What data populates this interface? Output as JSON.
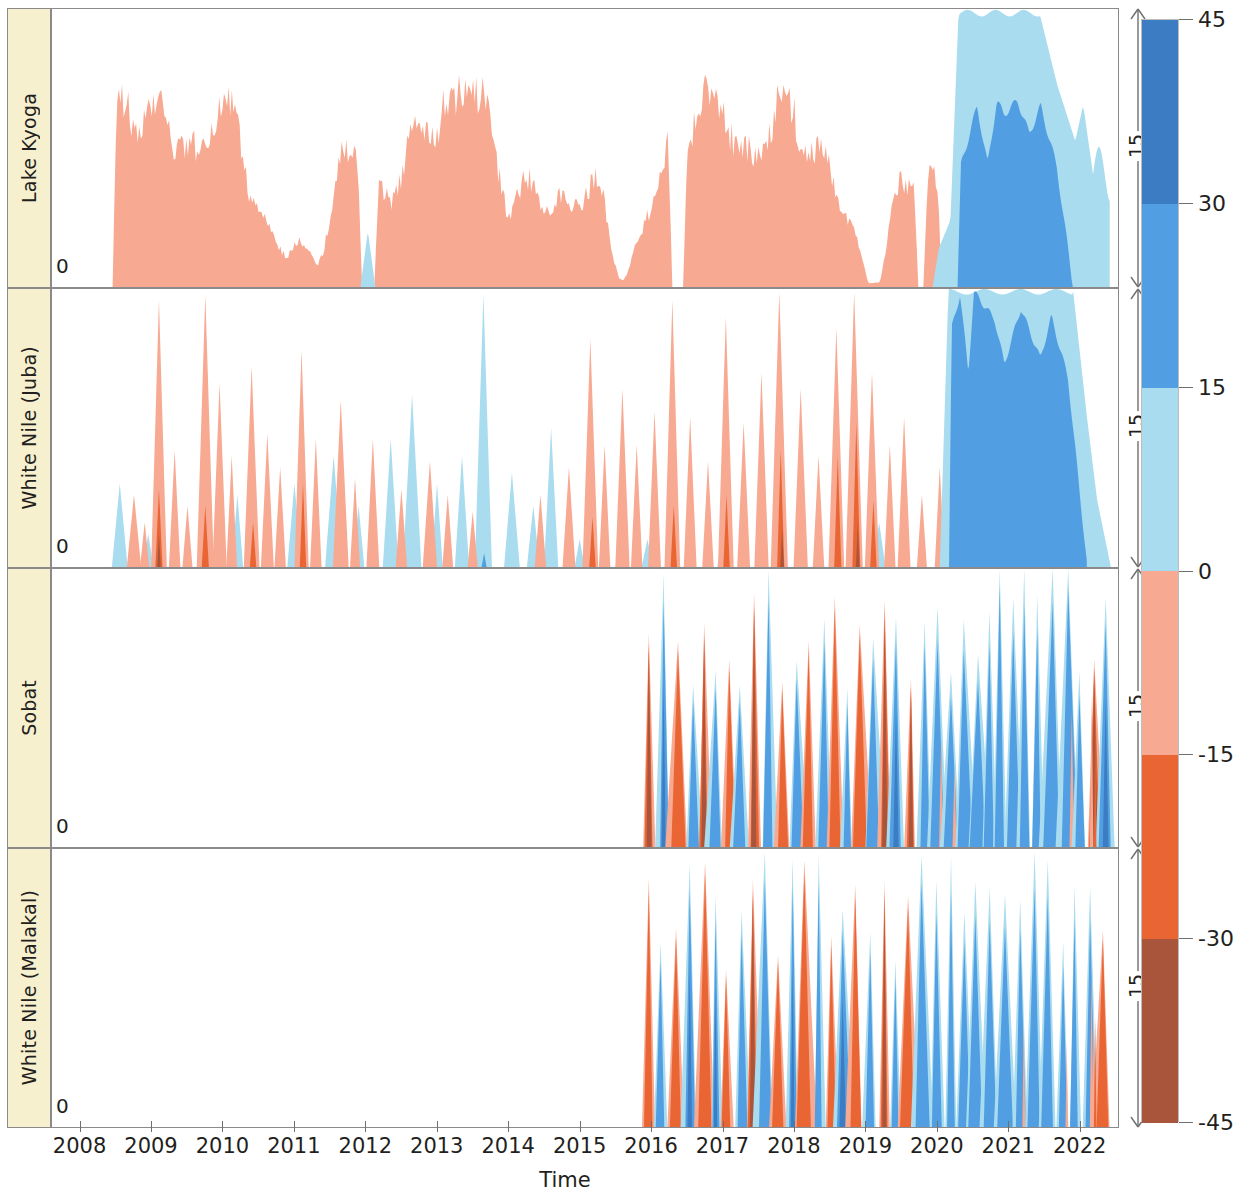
{
  "figure": {
    "type": "stacked-anomaly-ridgeline",
    "xlabel": "Time",
    "background": "#ffffff"
  },
  "axis": {
    "xlabel": "Time",
    "x_ticks": [
      "2008",
      "2009",
      "2010",
      "2011",
      "2012",
      "2013",
      "2014",
      "2015",
      "2016",
      "2017",
      "2018",
      "2019",
      "2020",
      "2021",
      "2022"
    ],
    "x_range": [
      2007.6,
      2022.55
    ],
    "zero_label": "0",
    "scale_bar_label": "15"
  },
  "colorbar": {
    "ticks": [
      "45",
      "30",
      "15",
      "0",
      "-15",
      "-30",
      "-45"
    ],
    "tick_values": [
      45,
      30,
      15,
      0,
      -15,
      -30,
      -45
    ],
    "vmin": -45,
    "vmax": 45,
    "bands": [
      {
        "from": 30,
        "to": 45,
        "color": "#3b7cc2"
      },
      {
        "from": 15,
        "to": 30,
        "color": "#519fe2"
      },
      {
        "from": 0,
        "to": 15,
        "color": "#a9dcef"
      },
      {
        "from": -15,
        "to": 0,
        "color": "#f8a992"
      },
      {
        "from": -30,
        "to": -15,
        "color": "#ea6534"
      },
      {
        "from": -45,
        "to": -30,
        "color": "#a9553c"
      }
    ]
  },
  "panels": [
    {
      "id": "lake-kyoga",
      "label": "Lake Kyoga",
      "zero_label": "0",
      "scale_label": "15"
    },
    {
      "id": "white-nile-juba",
      "label": "White Nile (Juba)",
      "zero_label": "0",
      "scale_label": "15"
    },
    {
      "id": "sobat",
      "label": "Sobat",
      "zero_label": "0",
      "scale_label": "15"
    },
    {
      "id": "white-nile-malakal",
      "label": "White Nile (Malakal)",
      "zero_label": "0",
      "scale_label": "15"
    }
  ],
  "chart_data": {
    "type": "area",
    "title": "",
    "xlabel": "Time",
    "ylabel": "",
    "x_range": [
      2007.6,
      2022.55
    ],
    "x_tick_labels": [
      "2008",
      "2009",
      "2010",
      "2011",
      "2012",
      "2013",
      "2014",
      "2015",
      "2016",
      "2017",
      "2018",
      "2019",
      "2020",
      "2021",
      "2022"
    ],
    "ylim": [
      0,
      15
    ],
    "grid": false,
    "legend": "colorbar-right",
    "colorbar_ticks": [
      45,
      30,
      15,
      0,
      -15,
      -30,
      -45
    ],
    "note": "Each panel shows nested filled areas; fill colour encodes anomaly magnitude class from the colorbar. Series values below are monthly-ish samples of the outer envelope height (panel units, 0-15) and the colour band index used for each segment.",
    "band_colors": [
      "#3b7cc2",
      "#519fe2",
      "#a9dcef",
      "#f8a992",
      "#ea6534",
      "#a9553c"
    ],
    "series": [
      {
        "name": "Lake Kyoga",
        "panel": "lake-kyoga",
        "x_start": 2007.6,
        "dx": 0.0833,
        "bands": [
          {
            "class": "0_to_-15",
            "color": "#f8a992",
            "values": [
              0,
              0,
              0,
              0,
              0,
              0,
              0,
              0,
              0,
              0,
              0,
              0,
              3.6,
              4.1,
              3.2,
              4.2,
              3.5,
              3.4,
              2.9,
              2.9,
              5.0,
              7.4,
              8.3,
              8.0,
              8.6,
              7.9,
              8.0,
              8.3,
              9.6,
              8.6,
              9.0,
              9.4,
              7.4,
              3.4,
              1.6,
              2.4,
              5.4,
              6.6,
              5.1,
              4.3,
              2.4,
              1.3,
              0.9,
              0.0,
              0.0,
              0.0,
              2.6,
              4.4,
              5.6,
              5.3,
              4.6,
              5.8,
              6.6,
              7.3,
              8.0,
              6.4,
              7.2,
              8.3,
              9.3,
              8.8,
              9.5,
              8.0,
              6.6,
              7.1,
              6.4,
              6.0,
              5.4,
              4.9,
              4.0,
              3.0,
              2.1,
              2.6,
              3.8,
              5.8,
              7.4,
              7.0,
              6.6,
              7.2,
              6.4,
              5.9,
              5.3,
              4.2,
              3.1,
              2.0,
              1.4,
              0.8,
              0.4,
              1.0,
              3.6,
              6.2,
              7.0,
              7.6,
              6.8,
              5.6,
              4.4,
              3.2,
              2.0,
              1.2,
              0.6,
              0.2,
              0.0,
              0.0,
              0.0,
              0.0,
              0.0,
              0.0,
              0.0,
              0.0,
              0.0,
              0.0,
              0.0,
              0.0,
              0.0,
              0.0,
              0.0,
              0.0,
              0.0,
              0.0,
              0.0,
              0.0,
              0.0,
              0.0,
              0.0,
              0.0,
              0.0,
              0.0,
              0.0,
              0.0,
              0.0,
              0.0,
              0.0,
              0.0,
              0.0,
              0.0,
              0.0,
              0.0,
              0.0,
              0.0,
              0.0,
              0.0,
              0.0,
              0.0,
              0.0,
              0.0,
              0.0,
              0.0,
              0.0,
              0.0,
              0.0,
              0.0,
              0.0,
              0.0,
              0.0,
              0.0,
              0.0,
              0.0,
              0.0,
              0.0,
              0.0,
              0.0,
              0.0,
              0.0,
              0.0,
              0.0,
              0.0,
              0.0,
              0.0,
              0.0,
              0.0,
              0.0,
              0.0,
              0.0
            ]
          },
          {
            "class": "0_to_15",
            "color": "#a9dcef",
            "values": [
              0,
              0,
              0,
              0,
              0,
              0,
              0,
              0,
              0,
              0,
              0,
              0,
              0,
              0,
              0,
              0,
              0,
              0,
              0,
              0,
              0,
              0,
              0,
              0,
              0,
              0,
              0,
              0,
              0,
              0,
              0,
              0,
              0,
              0,
              0,
              0,
              0,
              0,
              0,
              0,
              0,
              0,
              0,
              0,
              0.6,
              1.0,
              0.5,
              0,
              0,
              0,
              0,
              0,
              0,
              0,
              0,
              0,
              0,
              0,
              0,
              0,
              0,
              0,
              0,
              0,
              0,
              0,
              0,
              0,
              0,
              0,
              0,
              0,
              0,
              0,
              0,
              0,
              0,
              0,
              0,
              0,
              0,
              0,
              0,
              0,
              0,
              0,
              0,
              0,
              0,
              0,
              0,
              0,
              0,
              0,
              0,
              0,
              0,
              0,
              0,
              0,
              0,
              0,
              0,
              0,
              0,
              0,
              0,
              0.4,
              1.2,
              0,
              0,
              0,
              0,
              0,
              0,
              0,
              0,
              0,
              0,
              0,
              0,
              0,
              0,
              0,
              0,
              0,
              0,
              0,
              0,
              0,
              0,
              0,
              0,
              0,
              0,
              0,
              0,
              0,
              0,
              0,
              0,
              0,
              0,
              0,
              0,
              0,
              0,
              0,
              0,
              0,
              0,
              0,
              0,
              0,
              0,
              0,
              0,
              0,
              0,
              0,
              0,
              0,
              0,
              0,
              0,
              0,
              0,
              0,
              0,
              0,
              0,
              0,
              0,
              0,
              0,
              0,
              0
            ]
          },
          {
            "class": "0_to_15_late",
            "color": "#a9dcef",
            "values": [
              0,
              0,
              0,
              0,
              0,
              0,
              0,
              0,
              0,
              0,
              0,
              0,
              0,
              0,
              0,
              0,
              0,
              0,
              0,
              0,
              0,
              0,
              0,
              0,
              0,
              0,
              0,
              0,
              0,
              0,
              0,
              0,
              0,
              0,
              0,
              0,
              0,
              0,
              0,
              0,
              0,
              0,
              0,
              0,
              0,
              0,
              0,
              0,
              0,
              0,
              0,
              0,
              0,
              0,
              0,
              0,
              0,
              0,
              0,
              0,
              0,
              0,
              0,
              0,
              0,
              0,
              0,
              0,
              0,
              0,
              0,
              0,
              0,
              0,
              0,
              0,
              0,
              0,
              0,
              0,
              0,
              0,
              0,
              0,
              0,
              0,
              0,
              0,
              0,
              0,
              0,
              0,
              0,
              0,
              0,
              0,
              0,
              0,
              0,
              0,
              0,
              0,
              0,
              0,
              0,
              0,
              0,
              0,
              0,
              0,
              0,
              0,
              0,
              0,
              0,
              0,
              0,
              0,
              0,
              0,
              0,
              0,
              0,
              0,
              0,
              0,
              0,
              0,
              0,
              0,
              0,
              0,
              0,
              0,
              0,
              0,
              0,
              0,
              0,
              0,
              0,
              0,
              0,
              0,
              0,
              1.1,
              1.0,
              0.4,
              14.8,
              15,
              15,
              15,
              15,
              15,
              15,
              15,
              15,
              15,
              14.6,
              13.8,
              12.0,
              10.1,
              9.3,
              11.0,
              12.2,
              11.4,
              6.3,
              5.8,
              8.6,
              9.0,
              9.2
            ]
          },
          {
            "class": "15_to_30",
            "color": "#519fe2",
            "values": [
              0,
              0,
              0,
              0,
              0,
              0,
              0,
              0,
              0,
              0,
              0,
              0,
              0,
              0,
              0,
              0,
              0,
              0,
              0,
              0,
              0,
              0,
              0,
              0,
              0,
              0,
              0,
              0,
              0,
              0,
              0,
              0,
              0,
              0,
              0,
              0,
              0,
              0,
              0,
              0,
              0,
              0,
              0,
              0,
              0,
              0,
              0,
              0,
              0,
              0,
              0,
              0,
              0,
              0,
              0,
              0,
              0,
              0,
              0,
              0,
              0,
              0,
              0,
              0,
              0,
              0,
              0,
              0,
              0,
              0,
              0,
              0,
              0,
              0,
              0,
              0,
              0,
              0,
              0,
              0,
              0,
              0,
              0,
              0,
              0,
              0,
              0,
              0,
              0,
              0,
              0,
              0,
              0,
              0,
              0,
              0,
              0,
              0,
              0,
              0,
              0,
              0,
              0,
              0,
              0,
              0,
              0,
              0,
              0,
              0,
              0,
              0,
              0,
              0,
              0,
              0,
              0,
              0,
              0,
              0,
              0,
              0,
              0,
              0,
              0,
              0,
              0,
              0,
              0,
              0,
              0,
              0,
              0,
              0,
              0,
              0,
              0,
              0,
              0,
              0,
              0,
              0,
              0,
              0,
              0,
              0,
              0,
              0,
              0,
              0,
              3.2,
              6.4,
              8.8,
              9.0,
              8.4,
              7.2,
              7.7,
              8.2,
              9.5,
              10.2,
              9.1,
              7.5,
              6.8,
              8.0,
              9.4,
              9.8,
              8.6,
              5.2,
              1.0,
              0,
              0,
              0
            ]
          }
        ]
      },
      {
        "name": "White Nile (Juba)",
        "panel": "white-nile-juba",
        "x_start": 2007.6,
        "dx": 0.0833,
        "note": "Highly spiky monthly anomalies; large orange/salmon spikes 2008-2019, sustained deep-blue 2020-2022."
      },
      {
        "name": "Sobat",
        "panel": "sobat",
        "x_start": 2015.95,
        "dx": 0.0833,
        "note": "Record starts 2016. Alternating tall narrow brown/orange negative and blue positive spikes to full panel height."
      },
      {
        "name": "White Nile (Malakal)",
        "panel": "white-nile-malakal",
        "x_start": 2015.95,
        "dx": 0.0833,
        "note": "Record starts 2016. Alternating tall narrow orange/brown negative and blue positive spikes to full panel height."
      }
    ]
  }
}
